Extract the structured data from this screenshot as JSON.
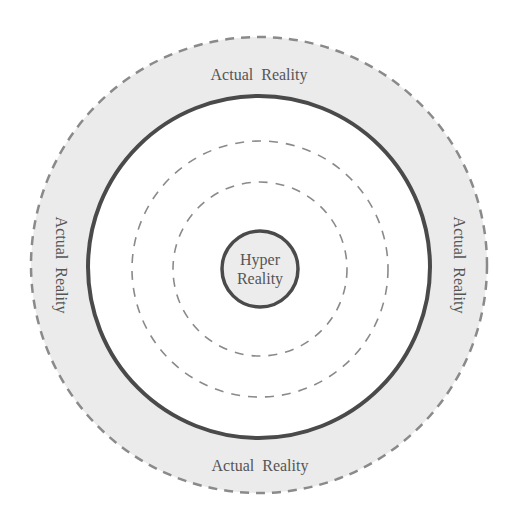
{
  "diagram": {
    "center_label": [
      "Hyper",
      "Reality"
    ],
    "outer_labels": {
      "top": "Actual Reality",
      "bottom": "Actual Reality",
      "left": "Actual Reality",
      "right": "Actual Reality"
    },
    "colors": {
      "outer_fill": "#ebebeb",
      "inner_fill": "#ffffff",
      "solid_stroke": "#4a4a4a",
      "dashed_stroke": "#8a8a8a",
      "center_fill": "#ececec",
      "text": "#555555"
    }
  }
}
